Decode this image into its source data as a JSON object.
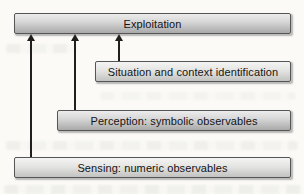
{
  "diagram": {
    "boxes": {
      "exploitation": {
        "label": "Exploitation"
      },
      "situation": {
        "label": "Situation and context identification"
      },
      "perception": {
        "label": "Perception: symbolic observables"
      },
      "sensing": {
        "label": "Sensing: numeric observables"
      }
    },
    "arrows": [
      {
        "from": "sensing",
        "to": "exploitation",
        "direction": "up"
      },
      {
        "from": "perception",
        "to": "exploitation",
        "direction": "up"
      },
      {
        "from": "situation",
        "to": "exploitation",
        "direction": "up"
      }
    ],
    "colors": {
      "box_border": "#565656",
      "box_fill_top": "#ececec",
      "box_fill_bottom": "#a9a9a9",
      "arrow": "#1f1f1f",
      "text": "#141414",
      "page_background": "#fbfaf7"
    }
  }
}
